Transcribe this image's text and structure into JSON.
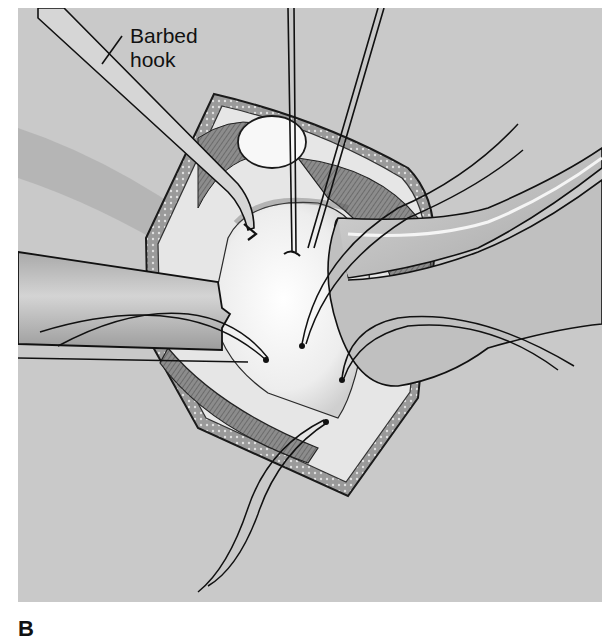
{
  "figure": {
    "type": "surgical-illustration",
    "rendering": "grayscale line drawing",
    "callouts": [
      {
        "label_line1": "Barbed",
        "label_line2": "hook",
        "points_to": "barbed-hook-instrument"
      }
    ],
    "panel_label": "B",
    "colors": {
      "background": "#c9c9c9",
      "tissue_light": "#f4f4f4",
      "muscle": "#8a8a8a",
      "instrument": "#b5b5b5",
      "outline": "#1a1a1a"
    }
  }
}
